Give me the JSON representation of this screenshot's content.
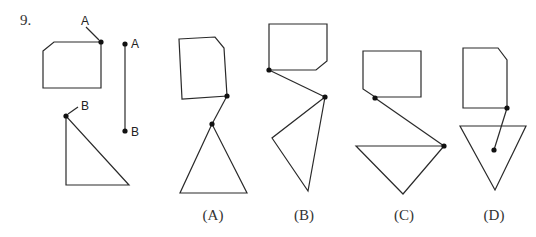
{
  "question": {
    "number": "9."
  },
  "given": {
    "pentagon_label": "A",
    "triangle_label": "B",
    "segment_top_label": "A",
    "segment_bottom_label": "B"
  },
  "options": [
    {
      "label": "(A)"
    },
    {
      "label": "(B)"
    },
    {
      "label": "(C)"
    },
    {
      "label": "(D)"
    }
  ],
  "colors": {
    "stroke": "#2a2a2a",
    "dot": "#111111",
    "background": "#ffffff"
  }
}
